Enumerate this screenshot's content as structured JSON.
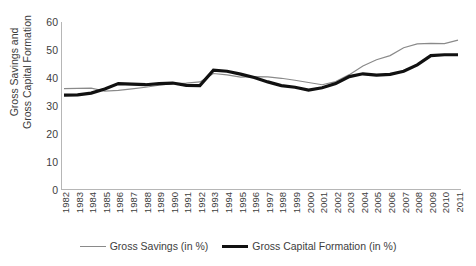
{
  "chart_data": {
    "type": "line",
    "title": "",
    "xlabel": "",
    "ylabel": "Gross Savings and Gross Capital Formation",
    "ylabel_lines": [
      "Gross Savings and",
      "Gross Capital Formation"
    ],
    "ylim": [
      0,
      60
    ],
    "y_ticks": [
      60,
      50,
      40,
      30,
      20,
      10,
      0
    ],
    "grid": false,
    "legend_position": "bottom",
    "x": [
      1982,
      1983,
      1984,
      1985,
      1986,
      1987,
      1988,
      1989,
      1990,
      1991,
      1992,
      1993,
      1994,
      1995,
      1996,
      1997,
      1998,
      1999,
      2000,
      2001,
      2002,
      2003,
      2004,
      2005,
      2006,
      2007,
      2008,
      2009,
      2010,
      2011
    ],
    "categories": [
      "1982",
      "1983",
      "1984",
      "1985",
      "1986",
      "1987",
      "1988",
      "1989",
      "1990",
      "1991",
      "1992",
      "1993",
      "1994",
      "1995",
      "1996",
      "1997",
      "1998",
      "1999",
      "2000",
      "2001",
      "2002",
      "2003",
      "2004",
      "2005",
      "2006",
      "2007",
      "2008",
      "2009",
      "2010",
      "2011"
    ],
    "series": [
      {
        "name": "Gross Savings (in %)",
        "color": "#8a8a8a",
        "width": 1.2,
        "values": [
          36.2,
          36.3,
          36.4,
          35.3,
          35.6,
          36.1,
          36.7,
          37.4,
          38.0,
          38.2,
          38.6,
          41.6,
          41.1,
          40.3,
          40.5,
          40.4,
          39.9,
          39.2,
          38.4,
          37.6,
          38.7,
          41.2,
          44.3,
          46.5,
          48.0,
          50.8,
          52.2,
          52.4,
          52.3,
          53.5
        ]
      },
      {
        "name": "Gross Capital Formation (in %)",
        "color": "#111111",
        "width": 3.2,
        "values": [
          33.9,
          34.0,
          34.6,
          36.1,
          38.0,
          37.8,
          37.6,
          38.0,
          38.2,
          37.4,
          37.3,
          42.8,
          42.4,
          41.4,
          40.2,
          38.6,
          37.3,
          36.7,
          35.7,
          36.5,
          38.0,
          40.5,
          41.5,
          41.0,
          41.3,
          42.4,
          44.7,
          48.0,
          48.3,
          48.3
        ]
      }
    ]
  },
  "legend": {
    "items": [
      {
        "label": "Gross Savings (in %)",
        "style": "thin"
      },
      {
        "label": "Gross Capital Formation (in %)",
        "style": "thick"
      }
    ]
  },
  "colors": {
    "gross_savings": "#8a8a8a",
    "gross_capital_formation": "#111111",
    "axis": "#b6b6b6",
    "text": "#3d3d3d",
    "background": "#ffffff"
  }
}
